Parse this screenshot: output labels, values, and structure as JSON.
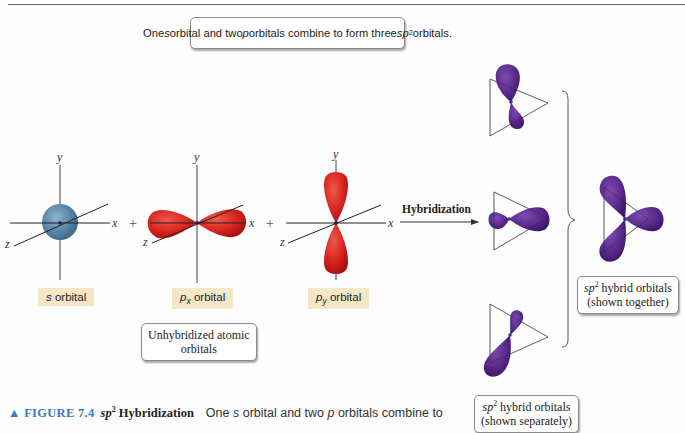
{
  "top_banner": {
    "pre_s": "One ",
    "s": "s",
    "mid": " orbital and two ",
    "p": "p",
    "mid2": " orbitals combine to form three ",
    "sp": "sp",
    "sup": "2",
    "post": " orbitals."
  },
  "axes": {
    "x": "x",
    "y": "y",
    "z": "z"
  },
  "operators": {
    "plus": "+"
  },
  "orbitals": {
    "s": {
      "letter": "s",
      "rest": " orbital",
      "color": "#5a86a8"
    },
    "px": {
      "letter": "p",
      "sub": "x",
      "rest": " orbital",
      "color": "#d8231f"
    },
    "py": {
      "letter": "p",
      "sub": "y",
      "rest": " orbital",
      "color": "#d8231f"
    }
  },
  "unhybridized_label": {
    "line1": "Unhybridized atomic",
    "line2": "orbitals"
  },
  "arrow_label": "Hybridization",
  "hybrid_color": "#5b2a8c",
  "together_label": {
    "sp": "sp",
    "sup": "2",
    "line1_rest": " hybrid orbitals",
    "line2": "(shown together)"
  },
  "separately_label": {
    "sp": "sp",
    "sup": "2",
    "line1_rest": " hybrid orbitals",
    "line2": "(shown separately)"
  },
  "caption": {
    "marker": "▲",
    "figure": "FIGURE 7.4",
    "title_sp": "sp",
    "title_sup": "2",
    "title_rest": " Hybridization",
    "body_pre": "One ",
    "body_s": "s",
    "body_mid": " orbital and two ",
    "body_p": "p",
    "body_post": " orbitals combine to"
  }
}
